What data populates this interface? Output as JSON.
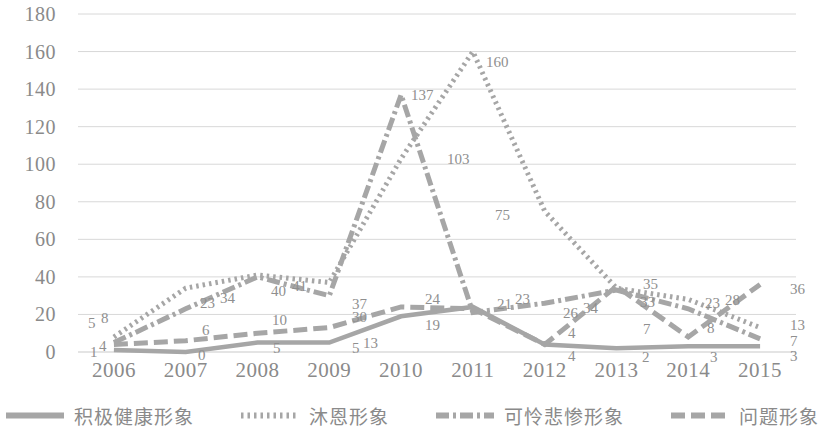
{
  "chart_data": {
    "type": "line",
    "title": "",
    "xlabel": "",
    "ylabel": "",
    "categories": [
      "2006",
      "2007",
      "2008",
      "2009",
      "2010",
      "2011",
      "2012",
      "2013",
      "2014",
      "2015"
    ],
    "ylim": [
      0,
      180
    ],
    "yticks": [
      "0",
      "20",
      "40",
      "60",
      "80",
      "100",
      "120",
      "140",
      "160",
      "180"
    ],
    "grid": true,
    "legend_position": "bottom",
    "series": [
      {
        "name": "积极健康形象",
        "style": "solid",
        "color": "#a6a6a6",
        "values": [
          1,
          0,
          5,
          5,
          19,
          24,
          4,
          2,
          3,
          3
        ],
        "labels": [
          "1",
          "0",
          "5",
          "5",
          "19",
          "24",
          "4",
          "2",
          "3",
          "3"
        ]
      },
      {
        "name": "沐恩形象",
        "style": "dotted",
        "color": "#a6a6a6",
        "values": [
          8,
          34,
          41,
          37,
          103,
          160,
          75,
          34,
          28,
          13
        ],
        "labels": [
          "8",
          "34",
          "41",
          "37",
          "103",
          "160",
          "75",
          "34",
          "28",
          "13"
        ]
      },
      {
        "name": "可怜悲惨形象",
        "style": "dash-dot",
        "color": "#a6a6a6",
        "values": [
          5,
          23,
          40,
          30,
          137,
          21,
          26,
          33,
          23,
          7
        ],
        "labels": [
          "5",
          "23",
          "40",
          "30",
          "137",
          "21",
          "26",
          "33",
          "23",
          "7"
        ]
      },
      {
        "name": "问题形象",
        "style": "dashed",
        "color": "#a6a6a6",
        "values": [
          4,
          6,
          10,
          13,
          24,
          23,
          4,
          35,
          8,
          36
        ],
        "labels": [
          "4",
          "6",
          "10",
          "13",
          "24",
          "23",
          "4",
          "35",
          "8",
          "36"
        ]
      }
    ]
  },
  "axis": {
    "y_labels": [
      "180",
      "160",
      "140",
      "120",
      "100",
      "80",
      "60",
      "40",
      "20",
      "0"
    ],
    "x_labels": [
      "2006",
      "2007",
      "2008",
      "2009",
      "2010",
      "2011",
      "2012",
      "2013",
      "2014",
      "2015"
    ]
  },
  "legend": {
    "items": [
      {
        "label": "积极健康形象",
        "style": "solid"
      },
      {
        "label": "沐恩形象",
        "style": "dotted"
      },
      {
        "label": "可怜悲惨形象",
        "style": "dash-dot"
      },
      {
        "label": "问题形象",
        "style": "dashed"
      }
    ]
  },
  "data_labels": [
    {
      "text": "5",
      "x": 88,
      "y": 316
    },
    {
      "text": "8",
      "x": 101,
      "y": 311
    },
    {
      "text": "1",
      "x": 90,
      "y": 345
    },
    {
      "text": "4",
      "x": 99,
      "y": 339
    },
    {
      "text": "23",
      "x": 200,
      "y": 296
    },
    {
      "text": "34",
      "x": 220,
      "y": 291
    },
    {
      "text": "6",
      "x": 202,
      "y": 323
    },
    {
      "text": "0",
      "x": 198,
      "y": 348
    },
    {
      "text": "40",
      "x": 271,
      "y": 284
    },
    {
      "text": "41",
      "x": 292,
      "y": 279
    },
    {
      "text": "10",
      "x": 272,
      "y": 313
    },
    {
      "text": "5",
      "x": 273,
      "y": 341
    },
    {
      "text": "37",
      "x": 352,
      "y": 297
    },
    {
      "text": "30",
      "x": 352,
      "y": 310
    },
    {
      "text": "5",
      "x": 352,
      "y": 341
    },
    {
      "text": "13",
      "x": 363,
      "y": 336
    },
    {
      "text": "137",
      "x": 411,
      "y": 88
    },
    {
      "text": "103",
      "x": 447,
      "y": 152
    },
    {
      "text": "24",
      "x": 425,
      "y": 292
    },
    {
      "text": "19",
      "x": 425,
      "y": 318
    },
    {
      "text": "160",
      "x": 486,
      "y": 55
    },
    {
      "text": "21",
      "x": 497,
      "y": 297
    },
    {
      "text": "23",
      "x": 515,
      "y": 292
    },
    {
      "text": "75",
      "x": 495,
      "y": 208
    },
    {
      "text": "26",
      "x": 563,
      "y": 306
    },
    {
      "text": "34",
      "x": 583,
      "y": 301
    },
    {
      "text": "4",
      "x": 568,
      "y": 326
    },
    {
      "text": "4",
      "x": 568,
      "y": 349
    },
    {
      "text": "35",
      "x": 643,
      "y": 277
    },
    {
      "text": "33",
      "x": 640,
      "y": 295
    },
    {
      "text": "7",
      "x": 643,
      "y": 322
    },
    {
      "text": "2",
      "x": 642,
      "y": 350
    },
    {
      "text": "23",
      "x": 705,
      "y": 296
    },
    {
      "text": "28",
      "x": 725,
      "y": 293
    },
    {
      "text": "8",
      "x": 707,
      "y": 321
    },
    {
      "text": "3",
      "x": 710,
      "y": 350
    },
    {
      "text": "36",
      "x": 790,
      "y": 282
    },
    {
      "text": "13",
      "x": 790,
      "y": 318
    },
    {
      "text": "7",
      "x": 790,
      "y": 334
    },
    {
      "text": "3",
      "x": 790,
      "y": 349
    }
  ]
}
